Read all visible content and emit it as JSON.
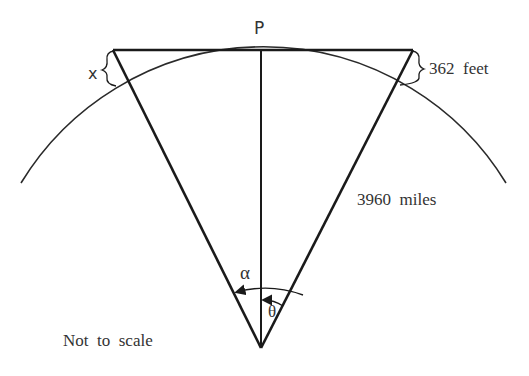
{
  "diagram": {
    "title": "",
    "labels": {
      "point_p": "P",
      "x": "x",
      "height": "362  feet",
      "radius": "3960  miles",
      "alpha": "α",
      "theta": "θ",
      "note": "Not  to  scale"
    },
    "colors": {
      "stroke": "#1a1a1a",
      "text": "#333333",
      "background": "#ffffff"
    }
  }
}
